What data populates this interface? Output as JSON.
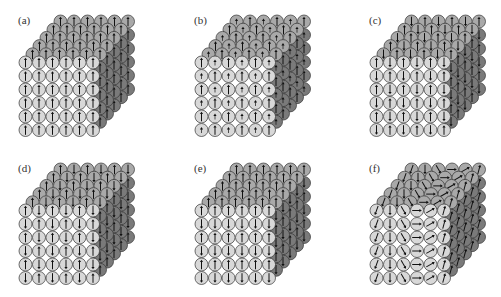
{
  "figure": {
    "colors": {
      "front_face": "#d8d8d8",
      "top_face": "#a9a9a9",
      "side_face": "#7a7a7a",
      "outline": "#333333",
      "arrow": "#111111",
      "background": "#ffffff"
    },
    "lattice": {
      "nx": 6,
      "ny": 6,
      "nz": 6
    },
    "panels": [
      {
        "id": "a",
        "label": "(a)",
        "pattern": "ferromagnetic",
        "front_rows": [
          [
            "up",
            "up",
            "up",
            "up",
            "up",
            "up"
          ],
          [
            "up",
            "up",
            "up",
            "up",
            "up",
            "up"
          ],
          [
            "up",
            "up",
            "up",
            "up",
            "up",
            "up"
          ],
          [
            "up",
            "up",
            "up",
            "up",
            "up",
            "up"
          ],
          [
            "up",
            "up",
            "up",
            "up",
            "up",
            "up"
          ],
          [
            "up",
            "up",
            "up",
            "up",
            "up",
            "up"
          ]
        ]
      },
      {
        "id": "b",
        "label": "(b)",
        "pattern": "ferrimagnetic",
        "front_rows": [
          [
            "up",
            "up-small",
            "up",
            "up-small",
            "up",
            "up-small"
          ],
          [
            "up-small",
            "up",
            "up-small",
            "up",
            "up-small",
            "up"
          ],
          [
            "up",
            "up-small",
            "up",
            "up-small",
            "up",
            "up-small"
          ],
          [
            "up-small",
            "up",
            "up-small",
            "up",
            "up-small",
            "up"
          ],
          [
            "up",
            "up-small",
            "up",
            "up-small",
            "up",
            "up-small"
          ],
          [
            "up-small",
            "up",
            "up-small",
            "up",
            "up-small",
            "up"
          ]
        ]
      },
      {
        "id": "c",
        "label": "(c)",
        "pattern": "checkerboard-antiferromagnetic",
        "front_rows": [
          [
            "up",
            "down",
            "up",
            "down",
            "up",
            "down"
          ],
          [
            "down",
            "up",
            "down",
            "up",
            "down",
            "up"
          ],
          [
            "up",
            "down",
            "up",
            "down",
            "up",
            "down"
          ],
          [
            "down",
            "up",
            "down",
            "up",
            "down",
            "up"
          ],
          [
            "up",
            "down",
            "up",
            "down",
            "up",
            "down"
          ],
          [
            "down",
            "up",
            "down",
            "up",
            "down",
            "up"
          ]
        ]
      },
      {
        "id": "d",
        "label": "(d)",
        "pattern": "column-antiferromagnetic",
        "front_rows": [
          [
            "up",
            "down",
            "up",
            "down",
            "up",
            "down"
          ],
          [
            "down",
            "up",
            "down",
            "up",
            "down",
            "up"
          ],
          [
            "up",
            "down",
            "up",
            "down",
            "up",
            "down"
          ],
          [
            "down",
            "up",
            "down",
            "up",
            "down",
            "up"
          ],
          [
            "up",
            "down",
            "up",
            "down",
            "up",
            "down"
          ],
          [
            "down",
            "up",
            "down",
            "up",
            "down",
            "up"
          ]
        ]
      },
      {
        "id": "e",
        "label": "(e)",
        "pattern": "layered-antiferromagnetic",
        "front_rows": [
          [
            "up",
            "up",
            "up",
            "up",
            "up",
            "up"
          ],
          [
            "down",
            "down",
            "down",
            "down",
            "down",
            "down"
          ],
          [
            "up",
            "up",
            "up",
            "up",
            "up",
            "up"
          ],
          [
            "down",
            "down",
            "down",
            "down",
            "down",
            "down"
          ],
          [
            "up",
            "up",
            "up",
            "up",
            "up",
            "up"
          ],
          [
            "down",
            "down",
            "down",
            "down",
            "down",
            "down"
          ]
        ]
      },
      {
        "id": "f",
        "label": "(f)",
        "pattern": "spiral",
        "column_angles_deg": [
          200,
          180,
          150,
          90,
          60,
          15
        ]
      }
    ]
  }
}
